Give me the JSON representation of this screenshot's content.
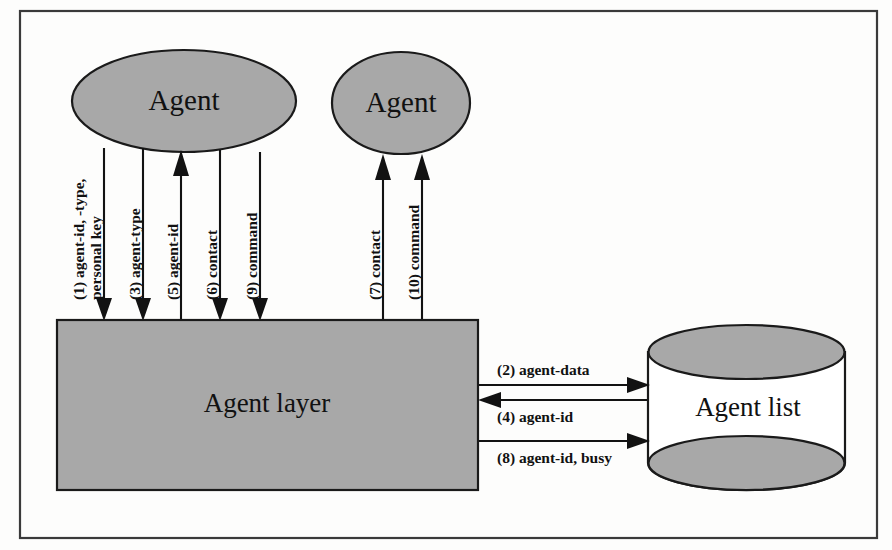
{
  "diagram": {
    "colors": {
      "shape_fill": "#a8a8a8",
      "shape_stroke": "#1a1a1a",
      "frame_stroke": "#3a3a3a",
      "background": "#fdfdfc",
      "cylinder_body": "#ffffff",
      "text": "#111111"
    },
    "nodes": [
      {
        "id": "agent1",
        "label": "Agent",
        "shape": "ellipse",
        "cx": 184,
        "cy": 101,
        "rx": 112,
        "ry": 51
      },
      {
        "id": "agent2",
        "label": "Agent",
        "shape": "ellipse",
        "cx": 401,
        "cy": 103,
        "rx": 69,
        "ry": 51
      },
      {
        "id": "agent-layer",
        "label": "Agent layer",
        "shape": "rect",
        "x": 57,
        "y": 320,
        "w": 421,
        "h": 170
      },
      {
        "id": "agent-list",
        "label": "Agent list",
        "shape": "cylinder",
        "x": 648,
        "y": 325,
        "w": 197,
        "h": 165
      }
    ],
    "edges": [
      {
        "id": "e1",
        "step": "(1)",
        "label_lines": [
          "(1) agent-id, -type,",
          "personal key"
        ],
        "orientation": "vertical",
        "direction": "down",
        "from": "agent1",
        "to": "agent-layer",
        "x": 104,
        "y_start": 152,
        "y_end": 319
      },
      {
        "id": "e3",
        "step": "(3)",
        "label_lines": [
          "(3) agent-type"
        ],
        "orientation": "vertical",
        "direction": "down",
        "from": "agent1",
        "to": "agent-layer",
        "x": 143,
        "y_start": 152,
        "y_end": 319
      },
      {
        "id": "e5",
        "step": "(5)",
        "label_lines": [
          "(5) agent-id"
        ],
        "orientation": "vertical",
        "direction": "up",
        "from": "agent-layer",
        "to": "agent1",
        "x": 181,
        "y_start": 319,
        "y_end": 152
      },
      {
        "id": "e6",
        "step": "(6)",
        "label_lines": [
          "(6) contact"
        ],
        "orientation": "vertical",
        "direction": "down",
        "from": "agent1",
        "to": "agent-layer",
        "x": 220,
        "y_start": 152,
        "y_end": 319
      },
      {
        "id": "e9",
        "step": "(9)",
        "label_lines": [
          "(9) command"
        ],
        "orientation": "vertical",
        "direction": "down",
        "from": "agent1",
        "to": "agent-layer",
        "x": 260,
        "y_start": 152,
        "y_end": 319
      },
      {
        "id": "e7",
        "step": "(7)",
        "label_lines": [
          "(7) contact"
        ],
        "orientation": "vertical",
        "direction": "up",
        "from": "agent-layer",
        "to": "agent2",
        "x": 383,
        "y_start": 319,
        "y_end": 155
      },
      {
        "id": "e10",
        "step": "(10)",
        "label_lines": [
          "(10) command"
        ],
        "orientation": "vertical",
        "direction": "up",
        "from": "agent-layer",
        "to": "agent2",
        "x": 422,
        "y_start": 319,
        "y_end": 155
      },
      {
        "id": "e2",
        "step": "(2)",
        "label_lines": [
          "(2) agent-data"
        ],
        "orientation": "horizontal",
        "direction": "right",
        "from": "agent-layer",
        "to": "agent-list",
        "y": 385,
        "x_start": 479,
        "x_end": 647
      },
      {
        "id": "e4",
        "step": "(4)",
        "label_lines": [
          "(4) agent-id"
        ],
        "orientation": "horizontal",
        "direction": "left",
        "from": "agent-list",
        "to": "agent-layer",
        "y": 400,
        "x_start": 647,
        "x_end": 479
      },
      {
        "id": "e8",
        "step": "(8)",
        "label_lines": [
          "(8) agent-id, busy"
        ],
        "orientation": "horizontal",
        "direction": "right",
        "from": "agent-layer",
        "to": "agent-list",
        "y": 441,
        "x_start": 479,
        "x_end": 647
      }
    ],
    "frame": {
      "x": 20,
      "y": 11,
      "w": 857,
      "h": 527
    }
  }
}
